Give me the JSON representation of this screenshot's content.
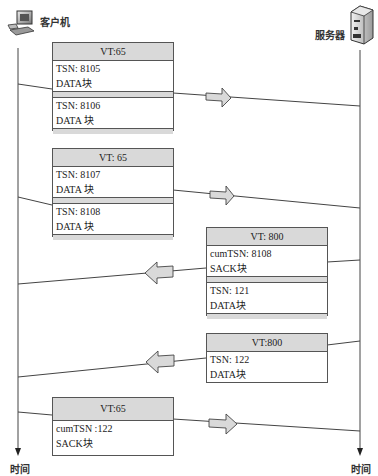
{
  "endpoints": {
    "client": {
      "label": "客户机",
      "icon": "computer-icon"
    },
    "server": {
      "label": "服务器",
      "icon": "server-icon"
    },
    "time_label_left": "时间",
    "time_label_right": "时间"
  },
  "packets": [
    {
      "direction": "client-to-server",
      "header": "VT:65",
      "chunks": [
        {
          "line1": "TSN: 8105",
          "line2": "DATA块"
        },
        {
          "line1": "TSN: 8106",
          "line2": "DATA 块"
        }
      ]
    },
    {
      "direction": "client-to-server",
      "header": "VT: 65",
      "chunks": [
        {
          "line1": "TSN: 8107",
          "line2": "DATA 块"
        },
        {
          "line1": "TSN: 8108",
          "line2": "DATA 块"
        }
      ]
    },
    {
      "direction": "server-to-client",
      "header": "VT: 800",
      "chunks": [
        {
          "line1": "cumTSN: 8108",
          "line2": "SACK块"
        },
        {
          "line1": "TSN: 121",
          "line2": "DATA块"
        }
      ]
    },
    {
      "direction": "server-to-client",
      "header": "VT:800",
      "chunks": [
        {
          "line1": "TSN: 122",
          "line2": "DATA块"
        }
      ]
    },
    {
      "direction": "client-to-server",
      "header": "VT:65",
      "chunks": [
        {
          "line1": "cumTSN :122",
          "line2": "SACK块"
        }
      ]
    }
  ],
  "colors": {
    "header_fill": "#d9d9d9",
    "arrow_fill": "#d9d9d9",
    "line": "#444444"
  }
}
